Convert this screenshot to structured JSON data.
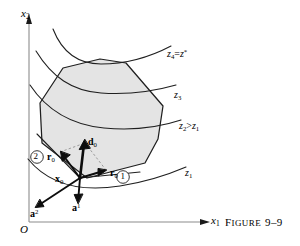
{
  "figure": {
    "caption_word": "F",
    "caption_rest": "IGURE",
    "caption_number": "9–9",
    "caption_full": "FIGURE 9–9"
  },
  "axes": {
    "origin_label": "O",
    "x_axis_label": "x",
    "x_axis_sub": "1",
    "y_axis_label": "x",
    "y_axis_sub": "2"
  },
  "contours": [
    {
      "id": "z1",
      "base": "z",
      "sub": "1",
      "text": "z₁"
    },
    {
      "id": "z2",
      "base": "z",
      "sub": "2",
      "rel": ">",
      "base2": "z",
      "sub2": "1",
      "text": "z₂>z₁"
    },
    {
      "id": "z3",
      "base": "z",
      "sub": "3",
      "text": "z₃"
    },
    {
      "id": "z4",
      "base": "z",
      "sub": "4",
      "eq": "=",
      "base2": "z",
      "sup2": "*",
      "text": "z₄=z*"
    }
  ],
  "regions": [
    {
      "id": "one",
      "label": "1"
    },
    {
      "id": "two",
      "label": "2"
    }
  ],
  "vectors": [
    {
      "id": "d0",
      "base": "d",
      "sub": "0",
      "text": "d₀"
    },
    {
      "id": "r0a",
      "base": "r",
      "sub": "0",
      "text": "r₀"
    },
    {
      "id": "r0b",
      "base": "r",
      "sub": "0",
      "text": "r₀"
    },
    {
      "id": "x0",
      "base": "x",
      "sub": "0",
      "text": "x₀"
    },
    {
      "id": "a1",
      "base": "a",
      "sup": "1",
      "text": "a¹"
    },
    {
      "id": "a2",
      "base": "a",
      "sup": "2",
      "text": "a²"
    }
  ],
  "colors": {
    "stroke": "#1a1a1a",
    "axis": "#7a7a7a",
    "fill": "#e3e3e3",
    "dashed": "#8a8a8a",
    "background": "#ffffff"
  }
}
